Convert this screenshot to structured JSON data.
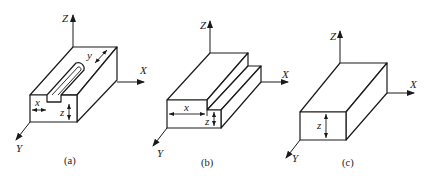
{
  "figure": {
    "panels": [
      {
        "id": "a",
        "caption": "(a)",
        "feature": "closed-end slot (keyway)",
        "axes": {
          "z": "Z",
          "x": "X",
          "y": "Y"
        },
        "dimensions": {
          "x": "x",
          "y": "y",
          "z": "z"
        }
      },
      {
        "id": "b",
        "caption": "(b)",
        "feature": "step",
        "axes": {
          "z": "Z",
          "x": "X",
          "y": "Y"
        },
        "dimensions": {
          "x": "x",
          "z": "z"
        }
      },
      {
        "id": "c",
        "caption": "(c)",
        "feature": "plain block",
        "axes": {
          "z": "Z",
          "x": "X",
          "y": "Y"
        },
        "dimensions": {
          "z": "z"
        }
      }
    ],
    "colors": {
      "line": "#1a1a1a",
      "background": "#ffffff"
    }
  }
}
